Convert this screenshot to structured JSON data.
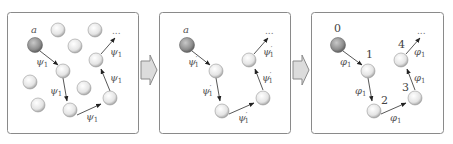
{
  "diagram": {
    "panels": [
      {
        "id": "panel-1",
        "start_label": "a",
        "edge_label": "ψ",
        "edge_sub": "1",
        "edge_prime": "",
        "trailing": "..."
      },
      {
        "id": "panel-2",
        "start_label": "a",
        "edge_label": "ψ",
        "edge_sub": "1",
        "edge_prime": "′",
        "trailing": "..."
      },
      {
        "id": "panel-3",
        "start_label": "0",
        "edge_label": "φ",
        "edge_sub": "1",
        "edge_prime": "",
        "node_labels": [
          "0",
          "1",
          "2",
          "3",
          "4"
        ],
        "trailing": "..."
      }
    ],
    "colors": {
      "start_node": "#9a9a9a",
      "node": "#e6e6e6",
      "panel_border": "#8a8a8a",
      "arrow_fill": "#dcdcdc"
    }
  }
}
